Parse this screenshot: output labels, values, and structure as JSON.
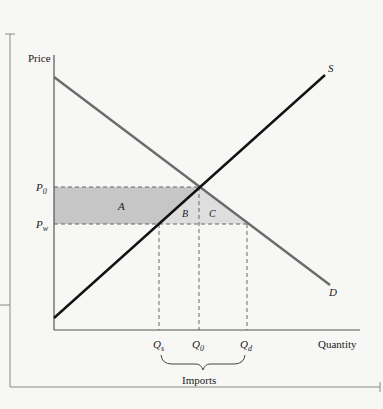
{
  "diagram": {
    "type": "supply-demand-imports",
    "axes": {
      "y_label": "Price",
      "x_label": "Quantity"
    },
    "curves": {
      "supply": {
        "label": "S",
        "color": "#111111"
      },
      "demand": {
        "label": "D",
        "color": "#6b6b6b"
      }
    },
    "prices": {
      "p0": {
        "base": "P",
        "sub": "0"
      },
      "pw": {
        "base": "P",
        "sub": "w"
      }
    },
    "quantities": {
      "qs": {
        "base": "Q",
        "sub": "s"
      },
      "q0": {
        "base": "Q",
        "sub": "0"
      },
      "qd": {
        "base": "Q",
        "sub": "d"
      }
    },
    "regions": {
      "a": "A",
      "b": "B",
      "c": "C"
    },
    "brace_label": "Imports",
    "colors": {
      "shade_dark": "#c6c6c6",
      "shade_light": "#dedede",
      "axis": "#555555",
      "dash": "#666666",
      "frame": "#8a8a8a"
    }
  }
}
